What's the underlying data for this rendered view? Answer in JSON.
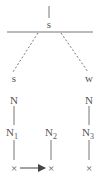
{
  "diagram": {
    "type": "syntax-tree",
    "colors": {
      "ink": "#555555",
      "line": "#777777",
      "background": "#ffffff"
    },
    "root": {
      "label": "s"
    },
    "left_branch": {
      "top": "s",
      "mid": "N",
      "sub_base": "N",
      "sub_index": "1",
      "leaf": "×"
    },
    "middle_branch": {
      "sub_base": "N",
      "sub_index": "2",
      "leaf": "×"
    },
    "right_branch": {
      "top": "w",
      "mid": "N",
      "sub_base": "N",
      "sub_index": "3",
      "leaf": "×"
    },
    "arrow": {
      "from": "N1 leaf",
      "to": "N2 leaf"
    }
  }
}
